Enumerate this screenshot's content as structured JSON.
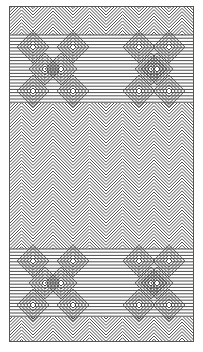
{
  "artwork": {
    "kind": "geometric line pattern",
    "colors": {
      "line": "#4a4a4a",
      "background": "#ffffff",
      "frame": "#555555"
    },
    "bands": [
      {
        "name": "top-diamond-band",
        "y_center": 68,
        "rows": 3
      },
      {
        "name": "middle-chevron-field",
        "y_start": 110,
        "y_end": 240
      },
      {
        "name": "bottom-diamond-band",
        "y_center": 282,
        "rows": 3
      }
    ],
    "diamond_columns_x": [
      32,
      72,
      138,
      168
    ],
    "chevron_peaks_x": [
      32,
      72,
      138,
      168
    ]
  }
}
